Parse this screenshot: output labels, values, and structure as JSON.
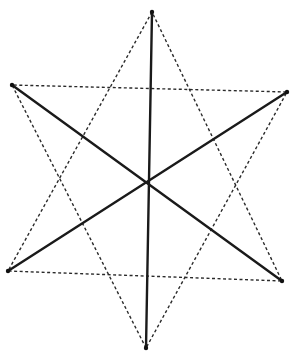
{
  "diagram": {
    "type": "hexagram-star-tetrahedron",
    "vertices": {
      "top": [
        152,
        12
      ],
      "upper_left": [
        12,
        85
      ],
      "upper_right": [
        287,
        92
      ],
      "lower_left": [
        8,
        271
      ],
      "lower_right": [
        282,
        281
      ],
      "bottom": [
        146,
        348
      ],
      "center": [
        148,
        182
      ]
    },
    "solid_lines": [
      [
        "top",
        "bottom"
      ],
      [
        "upper_left",
        "lower_right"
      ],
      [
        "upper_right",
        "lower_left"
      ]
    ],
    "dashed_triangles": [
      [
        "top",
        "lower_left",
        "lower_right"
      ],
      [
        "bottom",
        "upper_left",
        "upper_right"
      ]
    ],
    "colors": {
      "line": "#1a1a1a",
      "background": "#ffffff"
    }
  }
}
